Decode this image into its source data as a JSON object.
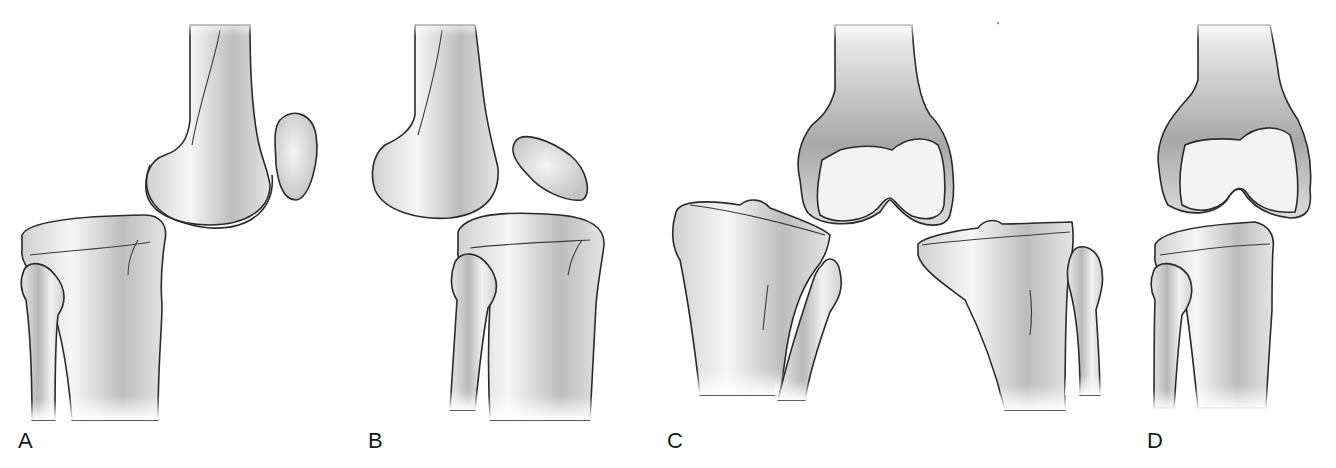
{
  "figure": {
    "panels": [
      {
        "id": "A",
        "label": "A",
        "view": "lateral",
        "bones": [
          "femur",
          "patella",
          "tibia",
          "fibula"
        ]
      },
      {
        "id": "B",
        "label": "B",
        "view": "lateral",
        "bones": [
          "femur",
          "patella",
          "tibia",
          "fibula"
        ]
      },
      {
        "id": "C",
        "label": "C",
        "view": "anterior",
        "bones": [
          "femur",
          "tibia (left displacement)",
          "fibula",
          "tibia (right displacement)",
          "fibula"
        ]
      },
      {
        "id": "D",
        "label": "D",
        "view": "anterior",
        "bones": [
          "femur",
          "tibia",
          "fibula"
        ]
      }
    ],
    "colors": {
      "background": "#ffffff",
      "outline": "#2a2a2a",
      "bone_light": "#f4f4f4",
      "bone_shade": "#9a9a9a",
      "label": "#1a1a1a"
    }
  }
}
